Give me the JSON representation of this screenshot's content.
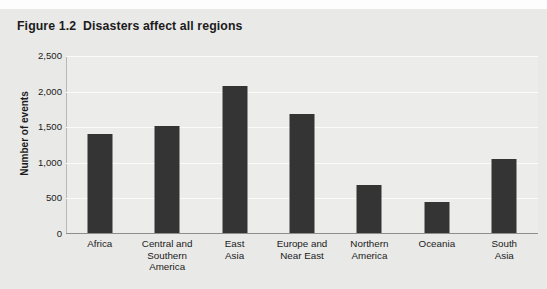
{
  "figure": {
    "title": "Figure 1.2  Disasters affect all regions"
  },
  "chart_data": {
    "type": "bar",
    "title": "Figure 1.2  Disasters affect all regions",
    "xlabel": "",
    "ylabel": "Number of events",
    "categories": [
      "Africa",
      "Central and\nSouthern\nAmerica",
      "East\nAsia",
      "Europe and\nNear East",
      "Northern\nAmerica",
      "Oceania",
      "South\nAsia"
    ],
    "values": [
      1400,
      1520,
      2080,
      1680,
      690,
      450,
      1050
    ],
    "ylim": [
      0,
      2500
    ],
    "yticks": [
      0,
      500,
      1000,
      1500,
      2000,
      2500
    ],
    "ytick_labels": [
      "0",
      "500",
      "1,000",
      "1,500",
      "2,000",
      "2,500"
    ],
    "grid": true,
    "legend": "none",
    "bar_color": "#343434",
    "plot_background": "#ececea",
    "page_background": "#e9e9e7"
  }
}
